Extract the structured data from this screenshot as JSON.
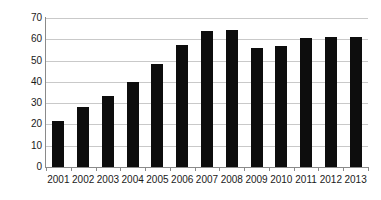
{
  "chart_data": {
    "type": "bar",
    "title": "",
    "subtitle": "",
    "xlabel": "",
    "ylabel": "",
    "categories": [
      "2001",
      "2002",
      "2003",
      "2004",
      "2005",
      "2006",
      "2007",
      "2008",
      "2009",
      "2010",
      "2011",
      "2012",
      "2013"
    ],
    "values": [
      21.5,
      28.0,
      33.5,
      40.0,
      48.5,
      57.5,
      64.0,
      64.5,
      56.0,
      57.0,
      60.5,
      61.0,
      61.0
    ],
    "series": [
      {
        "name": "",
        "values": [
          21.5,
          28.0,
          33.5,
          40.0,
          48.5,
          57.5,
          64.0,
          64.5,
          56.0,
          57.0,
          60.5,
          61.0,
          61.0
        ]
      }
    ],
    "ylim": [
      0,
      70
    ],
    "yticks": [
      0,
      10,
      20,
      30,
      40,
      50,
      60,
      70
    ],
    "ytick_labels": [
      "0",
      "10",
      "20",
      "30",
      "40",
      "50",
      "60",
      "70"
    ],
    "grid": "horizontal",
    "legend": "none",
    "annotations": [],
    "colors": {
      "bar": "#0d0d0d",
      "gridline": "#c9c9c9",
      "axis": "#8a8a8a",
      "background": "#ffffff",
      "tick_text": "#1a1a1a"
    }
  }
}
